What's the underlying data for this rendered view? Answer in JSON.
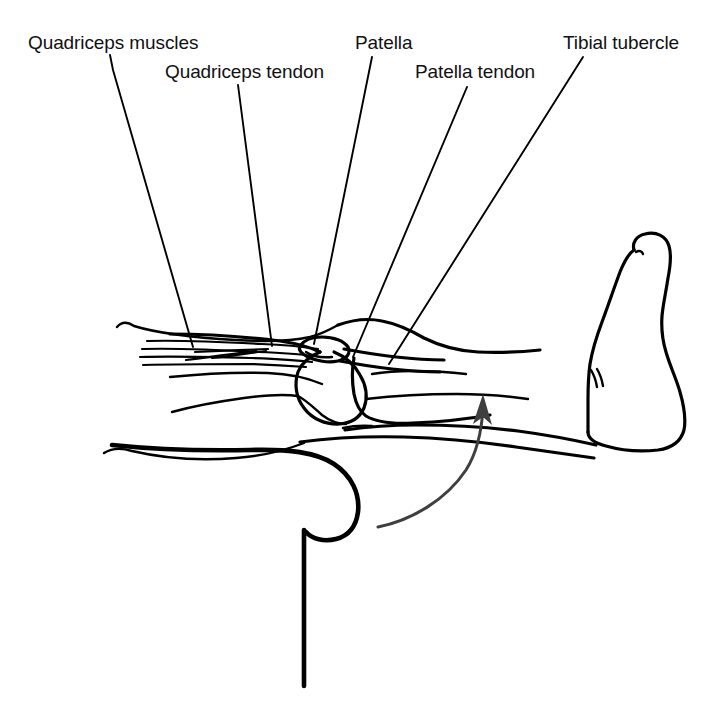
{
  "figure": {
    "background_color": "#ffffff",
    "ink_color": "#000000",
    "arrow_color": "#3f3f3f",
    "width": 712,
    "height": 723
  },
  "labels": [
    {
      "id": "quadriceps-muscles",
      "text": "Quadriceps muscles",
      "x": 28,
      "y": 33,
      "leader_start": [
        110,
        55
      ],
      "leader_end": [
        193,
        347
      ]
    },
    {
      "id": "quadriceps-tendon",
      "text": "Quadriceps tendon",
      "x": 165,
      "y": 62,
      "leader_start": [
        238,
        85
      ],
      "leader_end": [
        272,
        346
      ]
    },
    {
      "id": "patella",
      "text": "Patella",
      "x": 355,
      "y": 33,
      "leader_start": [
        372,
        57
      ],
      "leader_end": [
        314,
        344
      ]
    },
    {
      "id": "patella-tendon",
      "text": "Patella tendon",
      "x": 415,
      "y": 62,
      "leader_start": [
        467,
        87
      ],
      "leader_end": [
        353,
        357
      ]
    },
    {
      "id": "tibial-tubercle",
      "text": "Tibial tubercle",
      "x": 563,
      "y": 33,
      "leader_start": [
        583,
        57
      ],
      "leader_end": [
        389,
        364
      ]
    }
  ],
  "motion_arrow": {
    "id": "extension-arrow",
    "description": "curved arrow showing knee extension direction",
    "color": "#3f3f3f",
    "tip": [
      483,
      396
    ]
  },
  "anatomy_parts": [
    "quadriceps-muscle-striations",
    "femur-shaft",
    "femoral-condyle",
    "patella-bone",
    "patella-tendon-band",
    "tibia-shaft",
    "tibial-tubercle-bump",
    "thigh-outline-upper",
    "thigh-outline-lower",
    "calf-outline",
    "foot-outline",
    "seat-edge-vertical"
  ]
}
